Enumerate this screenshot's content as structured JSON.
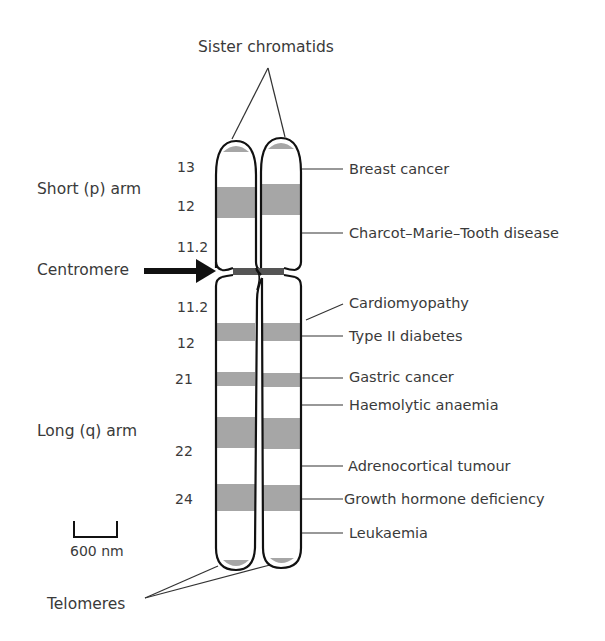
{
  "diagram": {
    "title_label": "Sister chromatids",
    "arm_labels": {
      "short": "Short (p) arm",
      "long": "Long (q) arm"
    },
    "centromere_label": "Centromere",
    "telomeres_label": "Telomeres",
    "scale_bar": {
      "label": "600 nm"
    },
    "band_numbers": {
      "p": [
        "13",
        "12",
        "11.2"
      ],
      "q": [
        "11.2",
        "12",
        "21",
        "22",
        "24"
      ]
    },
    "diseases": [
      {
        "name": "Breast cancer",
        "arm": "p"
      },
      {
        "name": "Charcot–Marie–Tooth disease",
        "arm": "p"
      },
      {
        "name": "Cardiomyopathy",
        "arm": "q"
      },
      {
        "name": "Type II diabetes",
        "arm": "q"
      },
      {
        "name": "Gastric cancer",
        "arm": "q"
      },
      {
        "name": "Haemolytic anaemia",
        "arm": "q"
      },
      {
        "name": "Adrenocortical tumour",
        "arm": "q"
      },
      {
        "name": "Growth hormone deficiency",
        "arm": "q"
      },
      {
        "name": "Leukaemia",
        "arm": "q"
      }
    ],
    "colors": {
      "outline": "#111111",
      "band": "#a6a6a6",
      "centromere": "#555555",
      "text": "#3a3a3a"
    }
  }
}
